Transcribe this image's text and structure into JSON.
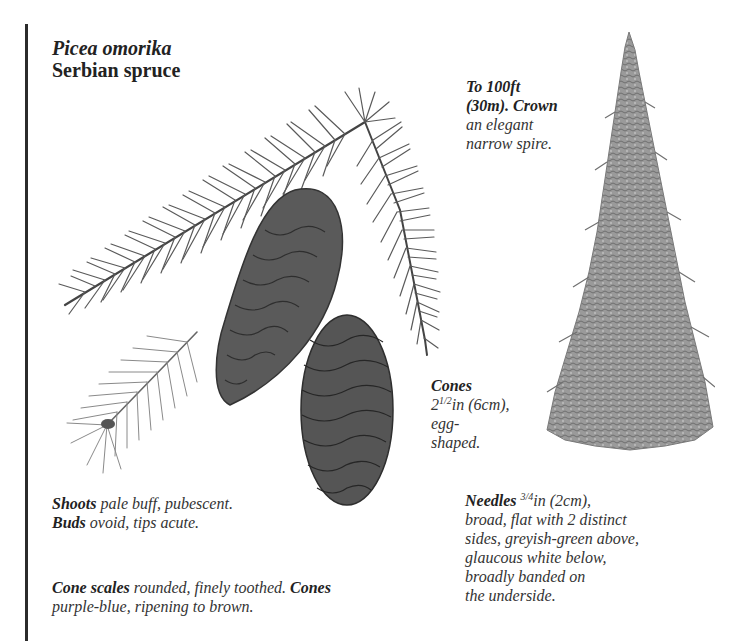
{
  "header": {
    "scientific_name": "Picea omorika",
    "common_name": "Serbian spruce"
  },
  "captions": {
    "height": {
      "label": "To 100ft",
      "label2": "(30m). Crown",
      "text1": "an elegant",
      "text2": "narrow spire."
    },
    "cones": {
      "label": "Cones",
      "size_whole": "2",
      "size_frac": "1/2",
      "size_rest": "in (6cm),",
      "text1": "egg-",
      "text2": "shaped."
    },
    "shoots": {
      "label1": "Shoots",
      "text1": " pale buff, pubescent.",
      "label2": "Buds",
      "text2": " ovoid, tips acute."
    },
    "cone_scales": {
      "label1": "Cone scales",
      "text1": " rounded, finely toothed. ",
      "label2": "Cones",
      "text2": "purple-blue, ripening to brown."
    },
    "needles": {
      "label": "Needles",
      "size_frac": "3/4",
      "size_rest": "in (2cm),",
      "lines": [
        "broad, flat with 2 distinct",
        "sides, greyish-green above,",
        "glaucous white below,",
        "broadly banded on",
        "the underside."
      ]
    }
  },
  "illustrations": {
    "branch": "spruce-branch-with-cones",
    "shoot": "young-shoot-with-bud",
    "tree": "serbian-spruce-tree-silhouette"
  },
  "colors": {
    "rule": "#2b2b2b",
    "text": "#2a2a2a",
    "needle": "#555555",
    "cone": "#4a4a4a",
    "tree": "#8a8a8a"
  }
}
